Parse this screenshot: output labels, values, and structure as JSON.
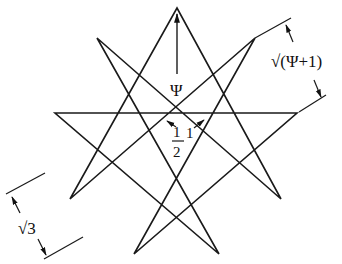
{
  "diagram": {
    "type": "enneagram {9/4} star with dimension annotations",
    "stroke_color": "#1a1a1a",
    "background": "#ffffff",
    "vertices": [
      {
        "name": "top",
        "x": 177,
        "y": 8
      },
      {
        "name": "upper-right",
        "x": 255,
        "y": 38
      },
      {
        "name": "right",
        "x": 297,
        "y": 113
      },
      {
        "name": "lower-right",
        "x": 281,
        "y": 199
      },
      {
        "name": "bottom-right",
        "x": 219,
        "y": 254
      },
      {
        "name": "bottom-left",
        "x": 134,
        "y": 254
      },
      {
        "name": "lower-left",
        "x": 70,
        "y": 199
      },
      {
        "name": "left",
        "x": 55,
        "y": 113
      },
      {
        "name": "upper-left",
        "x": 97,
        "y": 38
      }
    ],
    "labels": {
      "psi": "Ψ",
      "half_num": "1",
      "half_den": "2",
      "one": "1",
      "sqrt_psi_plus_one": "√(Ψ+1)",
      "sqrt_three": "√3"
    }
  }
}
